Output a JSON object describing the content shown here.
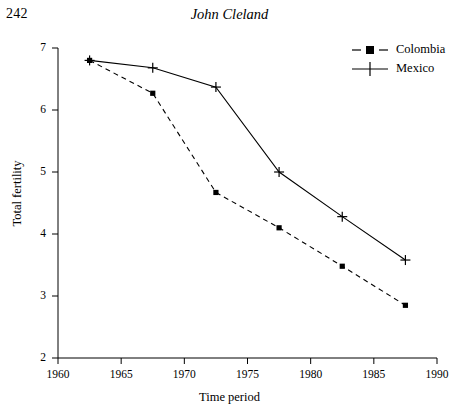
{
  "page": {
    "folio": "242",
    "running_title": "John Cleland"
  },
  "chart_data": {
    "type": "line",
    "title": "",
    "xlabel": "Time period",
    "ylabel": "Total fertility",
    "xlim": [
      1960,
      1990
    ],
    "ylim": [
      2,
      7
    ],
    "xticks": [
      "1960",
      "1965",
      "1970",
      "1975",
      "1980",
      "1985",
      "1990"
    ],
    "yticks": [
      "2",
      "3",
      "4",
      "5",
      "6",
      "7"
    ],
    "grid": false,
    "legend_position": "top-right",
    "x": [
      1962.5,
      1967.5,
      1972.5,
      1977.5,
      1982.5,
      1987.5
    ],
    "series": [
      {
        "name": "Colombia",
        "marker": "filled-square",
        "line_style": "dashed",
        "color": "#000000",
        "values": [
          6.8,
          6.27,
          4.67,
          4.1,
          3.48,
          2.85
        ]
      },
      {
        "name": "Mexico",
        "marker": "plus",
        "line_style": "solid",
        "color": "#000000",
        "values": [
          6.8,
          6.68,
          6.37,
          5.0,
          4.28,
          3.58
        ]
      }
    ]
  },
  "legend": {
    "items": [
      {
        "label": "Colombia"
      },
      {
        "label": "Mexico"
      }
    ]
  }
}
